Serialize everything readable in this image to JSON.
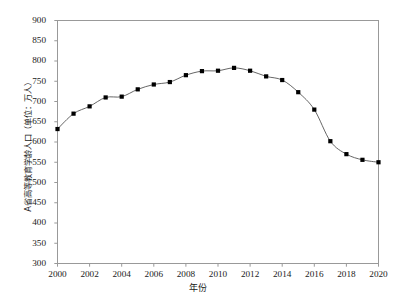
{
  "chart_data": {
    "type": "line",
    "title": "",
    "xlabel": "年份",
    "ylabel": "A省高等教育学龄人口（单位：万人）",
    "x": [
      2000,
      2001,
      2002,
      2003,
      2004,
      2005,
      2006,
      2007,
      2008,
      2009,
      2010,
      2011,
      2012,
      2013,
      2014,
      2015,
      2016,
      2017,
      2018,
      2019,
      2020
    ],
    "values": [
      632,
      670,
      688,
      710,
      712,
      730,
      742,
      748,
      765,
      775,
      776,
      783,
      776,
      762,
      753,
      723,
      680,
      602,
      570,
      556,
      550
    ],
    "series": [
      {
        "name": "A省高等教育学龄人口",
        "values": [
          632,
          670,
          688,
          710,
          712,
          730,
          742,
          748,
          765,
          775,
          776,
          783,
          776,
          762,
          753,
          723,
          680,
          602,
          570,
          556,
          550
        ]
      }
    ],
    "xlim": [
      2000,
      2020
    ],
    "ylim": [
      300,
      900
    ],
    "ytick_values": [
      300,
      350,
      400,
      450,
      500,
      550,
      600,
      650,
      700,
      750,
      800,
      850,
      900
    ],
    "ytick_labels": [
      "300",
      "350",
      "400",
      "450",
      "500",
      "550",
      "600",
      "650",
      "700",
      "750",
      "800",
      "850",
      "900"
    ],
    "xtick_values": [
      2000,
      2002,
      2004,
      2006,
      2008,
      2010,
      2012,
      2014,
      2016,
      2018,
      2020
    ],
    "xtick_labels": [
      "2000",
      "2002",
      "2004",
      "2006",
      "2008",
      "2010",
      "2012",
      "2014",
      "2016",
      "2018",
      "2020"
    ],
    "grid": false,
    "legend": "none",
    "marker": "square",
    "marker_color": "#000000",
    "line_color": "#555555",
    "frame_color": "#999999",
    "background": "#ffffff"
  }
}
